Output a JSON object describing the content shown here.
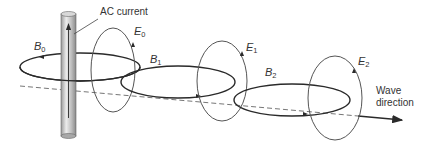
{
  "diagram": {
    "labels": {
      "current": "AC current",
      "wave_line1": "Wave",
      "wave_line2": "direction",
      "B0": {
        "sym": "B",
        "sub": "0"
      },
      "B1": {
        "sym": "B",
        "sub": "1"
      },
      "B2": {
        "sym": "B",
        "sub": "2"
      },
      "E0": {
        "sym": "E",
        "sub": "0"
      },
      "E1": {
        "sym": "E",
        "sub": "1"
      },
      "E2": {
        "sym": "E",
        "sub": "2"
      }
    },
    "colors": {
      "line": "#2a2a2a",
      "thin_line": "#555555",
      "rod_light": "#e6e6e6",
      "rod_dark": "#9a9a9a",
      "dash": "#666666"
    }
  }
}
